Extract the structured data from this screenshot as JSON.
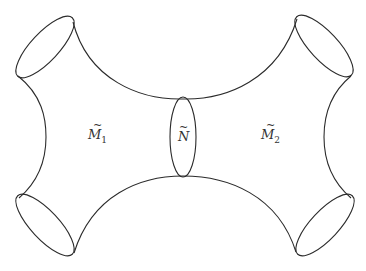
{
  "diagram": {
    "type": "manifold-connected-sum",
    "labels": {
      "m1": {
        "base": "M",
        "sub": "1",
        "tilde": "~"
      },
      "n": {
        "base": "N",
        "sub": "",
        "tilde": "~"
      },
      "m2": {
        "base": "M",
        "sub": "2",
        "tilde": "~"
      }
    },
    "stroke_color": "#2b2b2b",
    "boundary_ellipses": [
      "top-left",
      "top-right",
      "bottom-left",
      "bottom-right"
    ],
    "neck_ellipse": "center"
  }
}
